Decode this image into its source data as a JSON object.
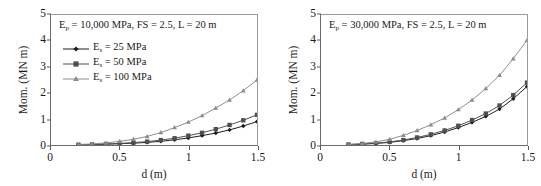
{
  "figure": {
    "panels": [
      {
        "id": "left",
        "annotation_html": "E<sub>p</sub> = 10,000 MPa, FS = 2.5, L = 20 m",
        "annotation_text": "Ep = 10,000 MPa, FS = 2.5, L = 20 m",
        "show_legend": true
      },
      {
        "id": "right",
        "annotation_html": "E<sub>p</sub> = 30,000 MPa, FS = 2.5, L = 20 m",
        "annotation_text": "Ep = 30,000 MPa, FS = 2.5, L = 20 m",
        "show_legend": false
      }
    ],
    "legend": {
      "entries": [
        {
          "label_html": "E<sub>s</sub> = 25 MPa",
          "label_text": "Es = 25 MPa",
          "marker": "diamond-marker",
          "color": "#1c1c1c"
        },
        {
          "label_html": "E<sub>s</sub> = 50 MPa",
          "label_text": "Es = 50 MPa",
          "marker": "square-marker",
          "color": "#4f4f4f"
        },
        {
          "label_html": "E<sub>s</sub> = 100 MPa",
          "label_text": "Es = 100 MPa",
          "marker": "triangle-marker",
          "color": "#8c8c8c"
        }
      ]
    }
  },
  "chart_data": [
    {
      "type": "line",
      "title": "Ep = 10,000 MPa, FS = 2.5, L = 20 m",
      "xlabel": "d (m)",
      "ylabel": "Mom. (MN m)",
      "xlim": [
        0,
        1.5
      ],
      "ylim": [
        0,
        5
      ],
      "xticks": [
        0,
        0.5,
        1,
        1.5
      ],
      "xtick_labels": [
        "0",
        "0.5",
        "1",
        "1.5"
      ],
      "yticks": [
        0,
        1,
        2,
        3,
        4,
        5
      ],
      "ytick_labels": [
        "0",
        "1",
        "2",
        "3",
        "4",
        "5"
      ],
      "grid": false,
      "legend_position": "upper left",
      "x": [
        0.2,
        0.3,
        0.4,
        0.5,
        0.6,
        0.7,
        0.8,
        0.9,
        1.0,
        1.1,
        1.2,
        1.3,
        1.4,
        1.5
      ],
      "series": [
        {
          "name": "Es = 25 MPa",
          "marker": "diamond",
          "color": "#1c1c1c",
          "values": [
            0.01,
            0.02,
            0.03,
            0.05,
            0.07,
            0.1,
            0.14,
            0.2,
            0.27,
            0.36,
            0.46,
            0.58,
            0.73,
            0.9
          ]
        },
        {
          "name": "Es = 50 MPa",
          "marker": "square",
          "color": "#4f4f4f",
          "values": [
            0.01,
            0.02,
            0.04,
            0.06,
            0.09,
            0.13,
            0.19,
            0.26,
            0.36,
            0.47,
            0.61,
            0.77,
            0.95,
            1.16
          ]
        },
        {
          "name": "Es = 100 MPa",
          "marker": "triangle",
          "color": "#8c8c8c",
          "values": [
            0.02,
            0.04,
            0.08,
            0.14,
            0.22,
            0.33,
            0.48,
            0.67,
            0.88,
            1.13,
            1.42,
            1.73,
            2.09,
            2.5
          ]
        }
      ]
    },
    {
      "type": "line",
      "title": "Ep = 30,000 MPa, FS = 2.5, L = 20 m",
      "xlabel": "d (m)",
      "ylabel": "Mom. (MN m)",
      "xlim": [
        0,
        1.5
      ],
      "ylim": [
        0,
        5
      ],
      "xticks": [
        0,
        0.5,
        1,
        1.5
      ],
      "xtick_labels": [
        "0",
        "0.5",
        "1",
        "1.5"
      ],
      "yticks": [
        0,
        1,
        2,
        3,
        4,
        5
      ],
      "ytick_labels": [
        "0",
        "1",
        "2",
        "3",
        "4",
        "5"
      ],
      "grid": false,
      "legend_position": "none",
      "x": [
        0.2,
        0.3,
        0.4,
        0.5,
        0.6,
        0.7,
        0.8,
        0.9,
        1.0,
        1.1,
        1.2,
        1.3,
        1.4,
        1.5
      ],
      "series": [
        {
          "name": "Es = 25 MPa",
          "marker": "diamond",
          "color": "#1c1c1c",
          "values": [
            0.01,
            0.03,
            0.06,
            0.1,
            0.17,
            0.25,
            0.36,
            0.5,
            0.67,
            0.87,
            1.1,
            1.38,
            1.78,
            2.25
          ]
        },
        {
          "name": "Es = 50 MPa",
          "marker": "square",
          "color": "#4f4f4f",
          "values": [
            0.02,
            0.04,
            0.07,
            0.12,
            0.19,
            0.29,
            0.41,
            0.56,
            0.74,
            0.96,
            1.21,
            1.52,
            1.92,
            2.4
          ]
        },
        {
          "name": "Es = 100 MPa",
          "marker": "triangle",
          "color": "#8c8c8c",
          "values": [
            0.02,
            0.06,
            0.12,
            0.22,
            0.37,
            0.56,
            0.78,
            1.04,
            1.36,
            1.73,
            2.17,
            2.68,
            3.32,
            4.03
          ]
        }
      ]
    }
  ]
}
